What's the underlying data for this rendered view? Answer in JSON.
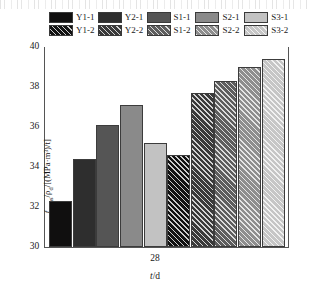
{
  "chart_data": {
    "type": "bar",
    "title": "",
    "xlabel": "t/d",
    "ylabel": "f_cu,as/ρ_d/[(MPa·m³)/t]",
    "categories": [
      "28"
    ],
    "ylim": [
      30,
      40
    ],
    "yticks": [
      30,
      32,
      34,
      36,
      38,
      40
    ],
    "ytick_labels": [
      "30",
      "32",
      "34",
      "36",
      "38",
      "40"
    ],
    "grid": false,
    "legend_position": "top",
    "series": [
      {
        "name": "Y1-1",
        "values": [
          32.3
        ],
        "color": "#100f0f",
        "hatch": "none"
      },
      {
        "name": "Y2-1",
        "values": [
          34.4
        ],
        "color": "#2e2e2e",
        "hatch": "none"
      },
      {
        "name": "S1-1",
        "values": [
          36.1
        ],
        "color": "#555555",
        "hatch": "none"
      },
      {
        "name": "S2-1",
        "values": [
          37.1
        ],
        "color": "#8a8a8a",
        "hatch": "none"
      },
      {
        "name": "S3-1",
        "values": [
          35.2
        ],
        "color": "#c2c2c2",
        "hatch": "none"
      },
      {
        "name": "Y1-2",
        "values": [
          34.6
        ],
        "color": "#121212",
        "hatch": "diagonal"
      },
      {
        "name": "Y2-2",
        "values": [
          37.7
        ],
        "color": "#3a3a3a",
        "hatch": "diagonal"
      },
      {
        "name": "S1-2",
        "values": [
          38.3
        ],
        "color": "#5e5e5e",
        "hatch": "diagonal"
      },
      {
        "name": "S2-2",
        "values": [
          39.0
        ],
        "color": "#8e8e8e",
        "hatch": "diagonal"
      },
      {
        "name": "S3-2",
        "values": [
          39.4
        ],
        "color": "#c6c6c6",
        "hatch": "diagonal"
      }
    ]
  },
  "legend": {
    "columns": [
      {
        "top": {
          "label": "Y1-1"
        },
        "bottom": {
          "label": "Y1-2"
        }
      },
      {
        "top": {
          "label": "Y2-1"
        },
        "bottom": {
          "label": "Y2-2"
        }
      },
      {
        "top": {
          "label": "S1-1"
        },
        "bottom": {
          "label": "S1-2"
        }
      },
      {
        "top": {
          "label": "S2-1"
        },
        "bottom": {
          "label": "S2-2"
        }
      },
      {
        "top": {
          "label": "S3-1"
        },
        "bottom": {
          "label": "S3-2"
        }
      }
    ]
  },
  "axes": {
    "x_category": "28",
    "x_title_symbol": "t",
    "x_title_rest": "/d",
    "y_title_plain": "f",
    "y_title_sub": "cu,as",
    "y_title_tail": "/ρ",
    "y_title_sub2": "d",
    "y_title_units": "/[(MPa·m³)/t]"
  }
}
